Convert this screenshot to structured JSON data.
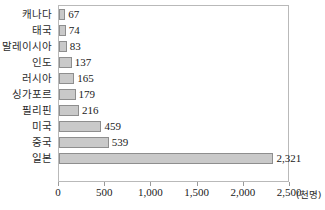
{
  "chart_data": {
    "type": "bar",
    "orientation": "horizontal",
    "title": "",
    "xlabel": "",
    "ylabel": "",
    "unit_label": "(천명)",
    "xlim": [
      0,
      2500
    ],
    "xticks": [
      0,
      500,
      1000,
      1500,
      2000,
      2500
    ],
    "xtick_labels": [
      "0",
      "500",
      "1,000",
      "1,500",
      "2,000",
      "2,500"
    ],
    "grid": false,
    "legend": null,
    "categories": [
      "캐나다",
      "태국",
      "말레이시아",
      "인도",
      "러시아",
      "싱가포르",
      "필리핀",
      "미국",
      "중국",
      "일본"
    ],
    "values": [
      67,
      74,
      83,
      137,
      165,
      179,
      216,
      459,
      539,
      2321
    ],
    "value_labels": [
      "67",
      "74",
      "83",
      "137",
      "165",
      "179",
      "216",
      "459",
      "539",
      "2,321"
    ],
    "bar_fill_color": "#c9c9c9",
    "bar_border_color": "#8e8e8e",
    "plot_border_color": "#b9b9b9",
    "text_color": "#1a1a1a"
  }
}
